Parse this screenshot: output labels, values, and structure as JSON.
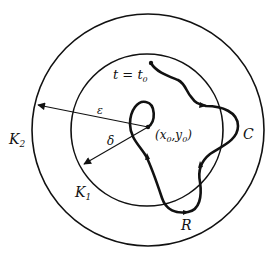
{
  "diagram": {
    "title": "",
    "labels": {
      "K2": "K",
      "K2_sub": "2",
      "K1": "K",
      "K1_sub": "1",
      "epsilon": "ε",
      "delta": "δ",
      "point": "(x",
      "point_sub0": "0",
      "point_mid": ",y",
      "point_sub1": "0",
      "point_end": ")",
      "t_start": "t = t",
      "t_start_sub": "0",
      "C": "C",
      "R": "R"
    },
    "elements": {
      "outer_circle": {
        "name": "K2",
        "cx": 148,
        "cy": 130,
        "r": 116
      },
      "inner_circle": {
        "name": "K1",
        "cx": 147,
        "cy": 130,
        "r": 76
      },
      "center_point": {
        "x": 148,
        "y": 127
      },
      "epsilon_arrow": {
        "from": [
          148,
          127
        ],
        "to": [
          37,
          105
        ]
      },
      "delta_arrow": {
        "from": [
          148,
          127
        ],
        "to": [
          83,
          165
        ]
      },
      "trajectory": {
        "start": [
          151,
          63
        ],
        "end": [
          148,
          127
        ],
        "label": "C"
      }
    },
    "colors": {
      "stroke": "#111111",
      "background": "#ffffff"
    }
  }
}
